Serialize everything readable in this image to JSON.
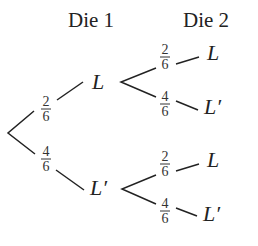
{
  "headers": {
    "die1": "Die 1",
    "die2": "Die 2"
  },
  "level1": {
    "upper": {
      "label": "L",
      "prob": {
        "num": "2",
        "den": "6"
      }
    },
    "lower": {
      "label": "L′",
      "prob": {
        "num": "4",
        "den": "6"
      }
    }
  },
  "level2": {
    "upper_upper": {
      "label": "L",
      "prob": {
        "num": "2",
        "den": "6"
      }
    },
    "upper_lower": {
      "label": "L′",
      "prob": {
        "num": "4",
        "den": "6"
      }
    },
    "lower_upper": {
      "label": "L",
      "prob": {
        "num": "2",
        "den": "6"
      }
    },
    "lower_lower": {
      "label": "L′",
      "prob": {
        "num": "4",
        "den": "6"
      }
    }
  }
}
